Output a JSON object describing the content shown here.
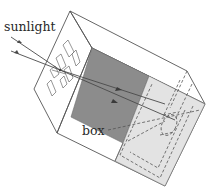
{
  "diagram": {
    "type": "pinhole camera box illustration",
    "labels": {
      "sunlight": "sunlight",
      "box": "box"
    },
    "colors": {
      "background": "#ffffff",
      "dark_panel": "#8c8c8c",
      "light_panel": "#e3e3e3",
      "edge": "#555555",
      "text": "#2a2a2a"
    },
    "elements": [
      "sunlight-arrows",
      "pinhole-face-with-rectangles",
      "box-outline",
      "dark-interior-panel",
      "light-screen-panel-with-dashed-frame",
      "light-rays-through-box"
    ]
  }
}
